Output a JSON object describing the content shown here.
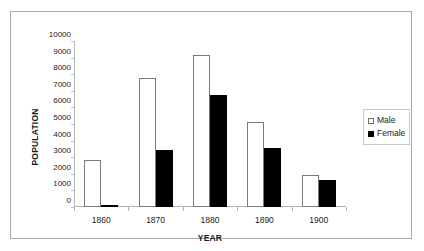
{
  "chart_data": {
    "type": "bar",
    "title": "",
    "xlabel": "YEAR",
    "ylabel": "POPULATION",
    "categories": [
      "1860",
      "1870",
      "1880",
      "1890",
      "1900"
    ],
    "series": [
      {
        "name": "Male",
        "color": "#ffffff",
        "values": [
          2850,
          7800,
          9150,
          5100,
          1900
        ]
      },
      {
        "name": "Female",
        "color": "#000000",
        "values": [
          150,
          3450,
          6750,
          3550,
          1650
        ]
      }
    ],
    "ylim": [
      0,
      10000
    ],
    "ytick_values": [
      0,
      1000,
      2000,
      3000,
      4000,
      5000,
      6000,
      7000,
      8000,
      9000,
      10000
    ],
    "ytick_labels": [
      "0",
      "1000",
      "2000",
      "3000",
      "4000",
      "5000",
      "6000",
      "7000",
      "8000",
      "9000",
      "10000"
    ],
    "grid": false,
    "legend_position": "right",
    "legend_entries": [
      "Male",
      "Female"
    ]
  },
  "axes": {
    "y_title": "POPULATION",
    "x_title": "YEAR"
  },
  "legend": {
    "items": [
      {
        "label": "Male"
      },
      {
        "label": "Female"
      }
    ]
  }
}
